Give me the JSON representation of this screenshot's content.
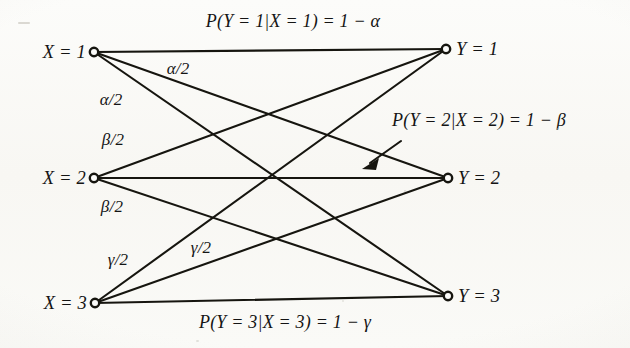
{
  "figure": {
    "type": "bipartite-channel-diagram",
    "background_color": "#fbfbf9",
    "ink_color": "#141414",
    "width": 630,
    "height": 348
  },
  "inputs": [
    {
      "id": "x1",
      "label": "X = 1",
      "cx": 94,
      "cy": 52
    },
    {
      "id": "x2",
      "label": "X = 2",
      "cx": 94,
      "cy": 178
    },
    {
      "id": "x3",
      "label": "X = 3",
      "cx": 95,
      "cy": 303
    }
  ],
  "outputs": [
    {
      "id": "y1",
      "label": "Y = 1",
      "cx": 446,
      "cy": 49
    },
    {
      "id": "y2",
      "label": "Y = 2",
      "cx": 448,
      "cy": 178
    },
    {
      "id": "y3",
      "label": "Y = 3",
      "cx": 448,
      "cy": 296
    }
  ],
  "edges": [
    {
      "from": "x1",
      "to": "y1",
      "label": "P(Y = 1|X = 1) = 1 − α"
    },
    {
      "from": "x1",
      "to": "y2",
      "label": "α/2"
    },
    {
      "from": "x1",
      "to": "y3",
      "label": "α/2"
    },
    {
      "from": "x2",
      "to": "y1",
      "label": "β/2"
    },
    {
      "from": "x2",
      "to": "y2",
      "label": "P(Y = 2|X = 2) = 1 − β"
    },
    {
      "from": "x2",
      "to": "y3",
      "label": "β/2"
    },
    {
      "from": "x3",
      "to": "y1",
      "label": "γ/2"
    },
    {
      "from": "x3",
      "to": "y2",
      "label": "γ/2"
    },
    {
      "from": "x3",
      "to": "y3",
      "label": "P(Y = 3|X = 3) = 1 − γ"
    }
  ],
  "probability_labels": {
    "top": {
      "text": "P(Y = 1|X = 1) = 1 − α",
      "x": 293,
      "y": 21
    },
    "middle": {
      "text": "P(Y = 2|X = 2) = 1 − β",
      "x": 479,
      "y": 120
    },
    "bottom": {
      "text": "P(Y = 3|X = 3) = 1 − γ",
      "x": 285,
      "y": 322
    }
  },
  "edge_labels": [
    {
      "id": "alpha-half-upper",
      "text": "α/2",
      "x": 178,
      "y": 68
    },
    {
      "id": "alpha-half-lower",
      "text": "α/2",
      "x": 111,
      "y": 99
    },
    {
      "id": "beta-half-upper",
      "text": "β/2",
      "x": 113,
      "y": 139
    },
    {
      "id": "beta-half-lower",
      "text": "β/2",
      "x": 112,
      "y": 206
    },
    {
      "id": "gamma-half-upper",
      "text": "γ/2",
      "x": 201,
      "y": 247
    },
    {
      "id": "gamma-half-lower",
      "text": "γ/2",
      "x": 118,
      "y": 259
    }
  ],
  "annotation_arrow": {
    "name": "pointer-arrow-to-middle-edge",
    "from_x": 401,
    "from_y": 141,
    "to_x": 364,
    "to_y": 167
  }
}
